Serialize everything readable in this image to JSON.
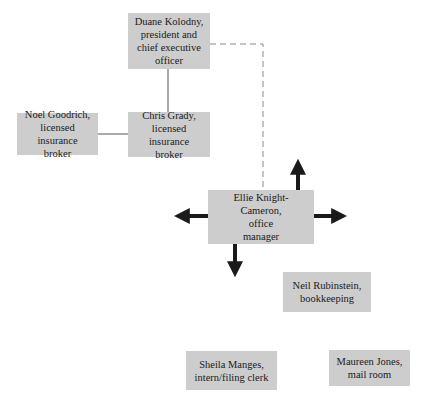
{
  "diagram": {
    "type": "org-chart",
    "colors": {
      "node_fill": "#cdcdcd",
      "text": "#1a1a1a",
      "solid_line": "#555555",
      "dashed_line": "#888888",
      "arrow": "#1a1a1a"
    },
    "nodes": [
      {
        "id": "duane",
        "name": "Duane Kolodny,",
        "role": "president and chief executive officer",
        "lines": [
          "Duane Kolodny,",
          "president and",
          "chief executive",
          "officer"
        ]
      },
      {
        "id": "noel",
        "name": "Noel Goodrich,",
        "role": "licensed insurance broker",
        "lines": [
          "Noel Goodrich,",
          "licensed insurance",
          "broker"
        ]
      },
      {
        "id": "chris",
        "name": "Chris Grady,",
        "role": "licensed insurance broker",
        "lines": [
          "Chris Grady,",
          "licensed insurance",
          "broker"
        ]
      },
      {
        "id": "ellie",
        "name": "Ellie Knight-Cameron,",
        "role": "office manager",
        "lines": [
          "Ellie Knight-",
          "Cameron,",
          "office",
          "manager"
        ]
      },
      {
        "id": "neil",
        "name": "Neil Rubinstein,",
        "role": "bookkeeping",
        "lines": [
          "Neil Rubinstein,",
          "bookkeeping"
        ]
      },
      {
        "id": "sheila",
        "name": "Sheila Manges,",
        "role": "intern/filing clerk",
        "lines": [
          "Sheila Manges,",
          "intern/filing clerk"
        ]
      },
      {
        "id": "maureen",
        "name": "Maureen Jones,",
        "role": "mail room",
        "lines": [
          "Maureen Jones,",
          "mail room"
        ]
      }
    ],
    "edges": [
      {
        "from": "duane",
        "to": "chris",
        "style": "solid"
      },
      {
        "from": "chris",
        "to": "noel",
        "style": "solid"
      },
      {
        "from": "duane",
        "to": "ellie",
        "style": "dashed"
      }
    ],
    "arrows": [
      {
        "from": "ellie",
        "direction": "up"
      },
      {
        "from": "ellie",
        "direction": "left"
      },
      {
        "from": "ellie",
        "direction": "right"
      },
      {
        "from": "ellie",
        "direction": "down"
      }
    ]
  }
}
